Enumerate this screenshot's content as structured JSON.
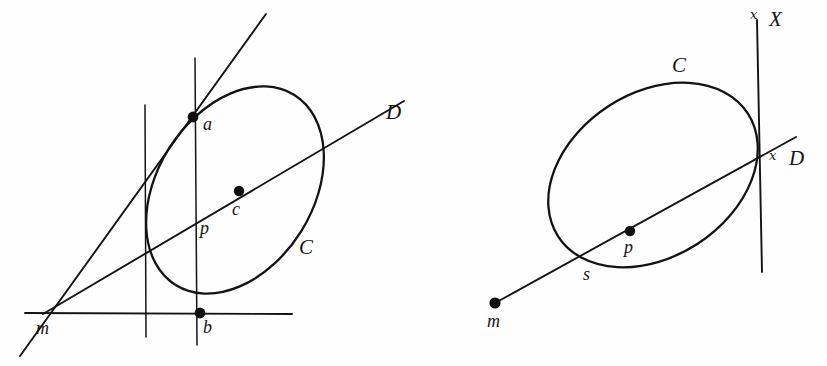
{
  "figure": {
    "background_color": "#fefefe",
    "ink_color": "#131313",
    "panels": [
      {
        "id": "left-panel",
        "name": "left-diagram",
        "labels": {
          "conic": "C",
          "secant_line": "D",
          "point_a": "a",
          "point_b": "b",
          "point_c": "c",
          "point_p": "p",
          "point_m": "m"
        },
        "points": [
          {
            "name": "a",
            "label": "a",
            "x": 193,
            "y": 117,
            "filled": true
          },
          {
            "name": "b",
            "label": "b",
            "x": 200,
            "y": 313,
            "filled": true
          },
          {
            "name": "c",
            "label": "c",
            "x": 239,
            "y": 191,
            "filled": true
          },
          {
            "name": "p",
            "label": "p",
            "x": 197,
            "y": 219,
            "filled": false
          },
          {
            "name": "m",
            "label": "m",
            "x": 45,
            "y": 313,
            "filled": false
          }
        ],
        "lines": [
          {
            "name": "tangent-through-a",
            "x1": 20,
            "y1": 356,
            "x2": 266,
            "y2": 14
          },
          {
            "name": "secant-line-D",
            "x1": 43,
            "y1": 314,
            "x2": 404,
            "y2": 101
          },
          {
            "name": "horizontal-polar",
            "x1": 25,
            "y1": 313,
            "x2": 292,
            "y2": 314
          },
          {
            "name": "vertical-left",
            "x1": 145,
            "y1": 105,
            "x2": 146,
            "y2": 337
          },
          {
            "name": "vertical-through-ab",
            "x1": 195,
            "y1": 58,
            "x2": 197,
            "y2": 345
          }
        ],
        "conic": {
          "name": "ellipse-C",
          "cx": 235,
          "cy": 190,
          "rx": 112,
          "ry": 78,
          "rotation": -58
        }
      },
      {
        "id": "right-panel",
        "name": "right-diagram",
        "labels": {
          "conic": "C",
          "secant_line": "D",
          "polar_line": "X",
          "point_s": "s",
          "point_p": "p",
          "point_m": "m",
          "script_marker_x": "x",
          "script_marker_d": "x"
        },
        "points": [
          {
            "name": "p",
            "label": "p",
            "x": 630,
            "y": 231,
            "filled": true
          },
          {
            "name": "m",
            "label": "m",
            "x": 495,
            "y": 303,
            "filled": true
          },
          {
            "name": "s",
            "label": "s",
            "x": 578,
            "y": 265,
            "filled": false
          }
        ],
        "lines": [
          {
            "name": "secant-line-D",
            "x1": 495,
            "y1": 303,
            "x2": 796,
            "y2": 137
          },
          {
            "name": "polar-line-X",
            "x1": 757,
            "y1": 20,
            "x2": 762,
            "y2": 272
          }
        ],
        "conic": {
          "name": "ellipse-C",
          "cx": 653,
          "cy": 175,
          "rx": 113,
          "ry": 82,
          "rotation": -33
        }
      }
    ]
  }
}
